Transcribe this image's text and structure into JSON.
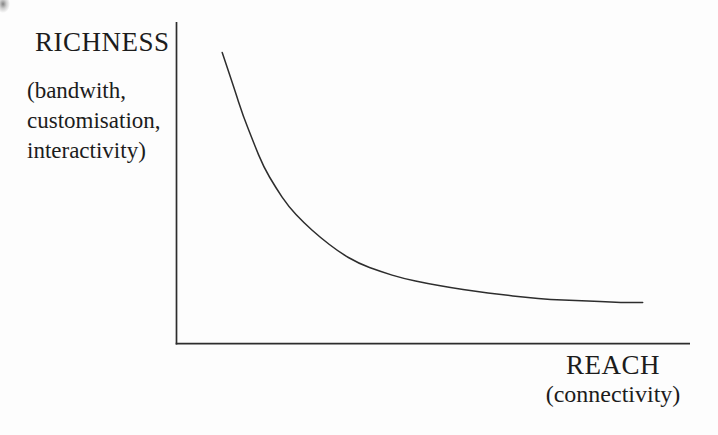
{
  "figure": {
    "y_axis": {
      "title": "RICHNESS",
      "subtitle_lines": [
        "(bandwith,",
        "customisation,",
        "interactivity)"
      ]
    },
    "x_axis": {
      "title": "REACH",
      "subtitle": "(connectivity)"
    },
    "colors": {
      "ink": "#2d2d2d",
      "text": "#1c1c1c",
      "background": "#fdfdfd"
    }
  },
  "chart_data": {
    "type": "line",
    "title": "",
    "xlabel": "REACH (connectivity)",
    "ylabel": "RICHNESS (bandwith, customisation, interactivity)",
    "xlim": [
      0,
      1
    ],
    "ylim": [
      0,
      1
    ],
    "grid": false,
    "legend": false,
    "series": [
      {
        "name": "richness-reach-tradeoff",
        "points": [
          [
            0.089,
            0.904
          ],
          [
            0.111,
            0.799
          ],
          [
            0.13,
            0.706
          ],
          [
            0.15,
            0.625
          ],
          [
            0.169,
            0.551
          ],
          [
            0.193,
            0.486
          ],
          [
            0.218,
            0.427
          ],
          [
            0.247,
            0.378
          ],
          [
            0.28,
            0.331
          ],
          [
            0.315,
            0.288
          ],
          [
            0.354,
            0.251
          ],
          [
            0.397,
            0.226
          ],
          [
            0.442,
            0.204
          ],
          [
            0.488,
            0.189
          ],
          [
            0.533,
            0.176
          ],
          [
            0.582,
            0.164
          ],
          [
            0.63,
            0.155
          ],
          [
            0.679,
            0.146
          ],
          [
            0.728,
            0.139
          ],
          [
            0.776,
            0.136
          ],
          [
            0.825,
            0.133
          ],
          [
            0.864,
            0.13
          ],
          [
            0.907,
            0.13
          ]
        ]
      }
    ]
  }
}
